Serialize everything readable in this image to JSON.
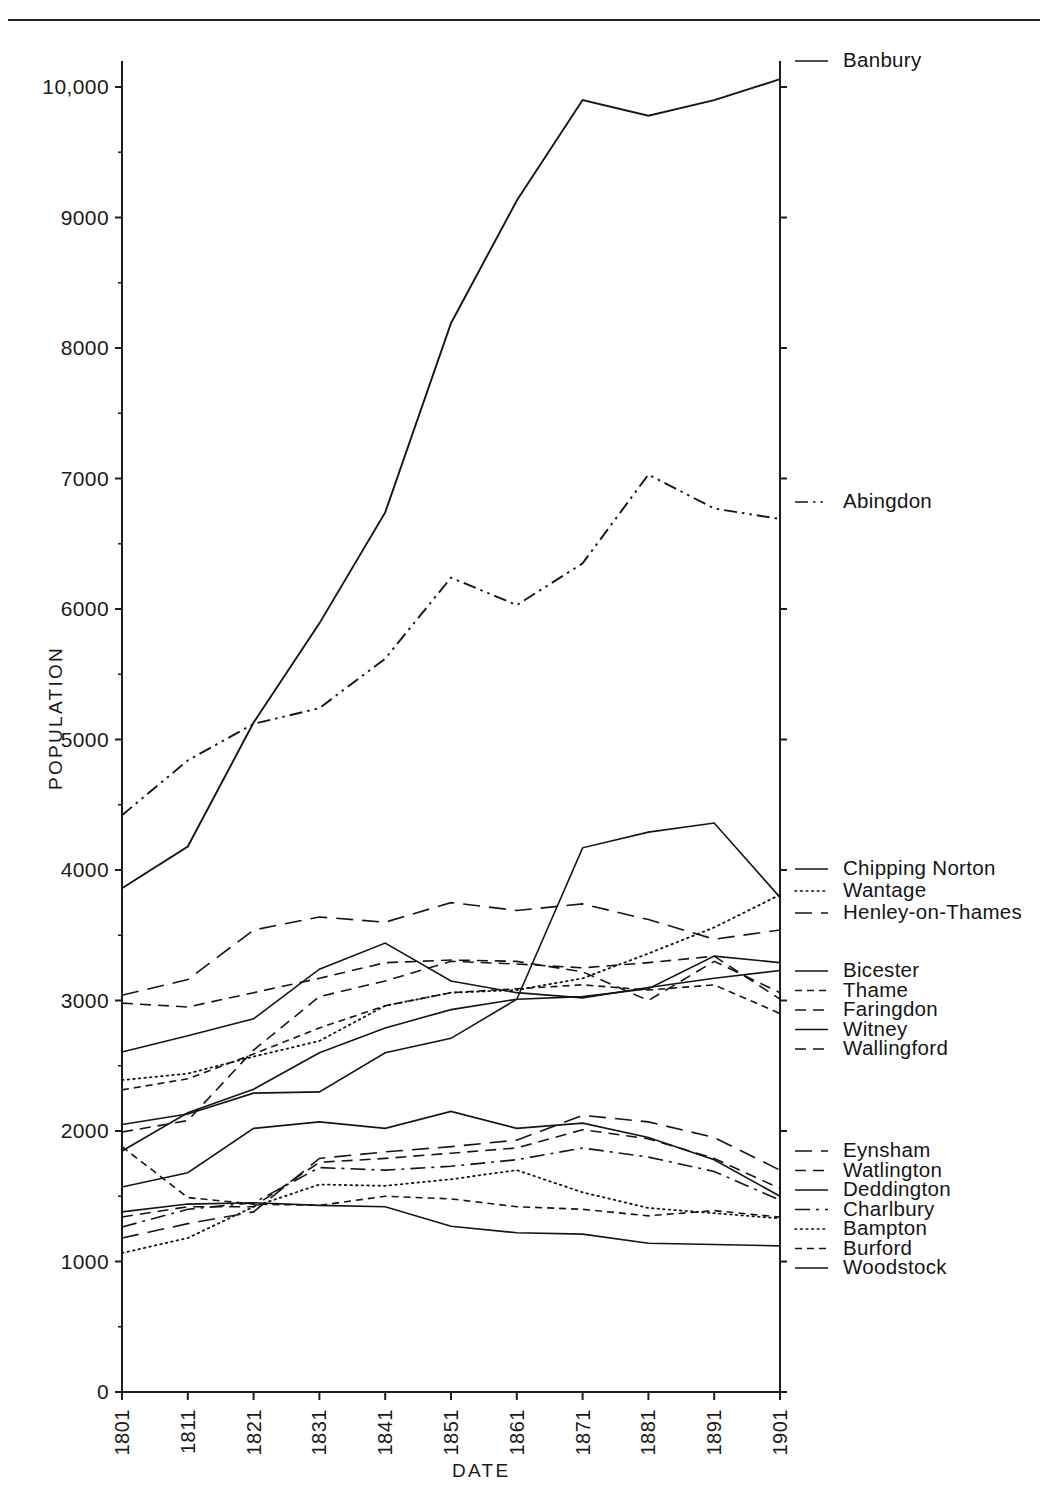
{
  "figure": {
    "xlabel": "DATE",
    "ylabel": "POPULATION"
  },
  "chart_data": {
    "type": "line",
    "title": "",
    "xlabel": "DATE",
    "ylabel": "POPULATION",
    "x": [
      1801,
      1811,
      1821,
      1831,
      1841,
      1851,
      1861,
      1871,
      1881,
      1891,
      1901
    ],
    "xticklabels": [
      "1801",
      "1811",
      "1821",
      "1831",
      "1841",
      "1851",
      "1861",
      "1871",
      "1881",
      "1891",
      "1901"
    ],
    "yticklabels": [
      "0",
      "1000",
      "2000",
      "3000",
      "4000",
      "5000",
      "6000",
      "7000",
      "8000",
      "9000",
      "10,000"
    ],
    "yticks": [
      0,
      1000,
      2000,
      3000,
      4000,
      5000,
      6000,
      7000,
      8000,
      9000,
      10000
    ],
    "ylim": [
      0,
      10200
    ],
    "xlim": [
      1801,
      1901
    ],
    "minor_y_step": 500,
    "grid": false,
    "legend_position": "right",
    "series": [
      {
        "name": "Banbury",
        "style": "solid",
        "values": [
          3860,
          4180,
          5130,
          5890,
          6740,
          8190,
          9130,
          9900,
          9780,
          9900,
          10060
        ]
      },
      {
        "name": "Abingdon",
        "style": "dashdotdot",
        "values": [
          4420,
          4840,
          5120,
          5240,
          5620,
          6240,
          6030,
          6350,
          7030,
          6770,
          6690
        ]
      },
      {
        "name": "Chipping Norton",
        "style": "solid",
        "values": [
          2050,
          2130,
          2290,
          2300,
          2600,
          2710,
          3010,
          4170,
          4290,
          4360,
          3790
        ]
      },
      {
        "name": "Wantage",
        "style": "dotted",
        "values": [
          2390,
          2440,
          2570,
          2690,
          2960,
          3060,
          3080,
          3170,
          3360,
          3560,
          3810
        ]
      },
      {
        "name": "Henley-on-Thames",
        "style": "dashed-long",
        "values": [
          3040,
          3160,
          3540,
          3640,
          3600,
          3750,
          3690,
          3740,
          3620,
          3470,
          3540
        ]
      },
      {
        "name": "Bicester",
        "style": "solid",
        "values": [
          2605,
          2730,
          2860,
          3240,
          3440,
          3150,
          3060,
          3020,
          3100,
          3170,
          3230
        ]
      },
      {
        "name": "Thame",
        "style": "dashed-fine",
        "values": [
          2315,
          2400,
          2590,
          2790,
          2960,
          3060,
          3090,
          3120,
          3080,
          3120,
          2900
        ]
      },
      {
        "name": "Faringdon",
        "style": "dashed",
        "values": [
          2980,
          2950,
          3060,
          3170,
          3290,
          3310,
          3300,
          3220,
          3000,
          3300,
          3060
        ]
      },
      {
        "name": "Witney",
        "style": "solid",
        "values": [
          1847,
          2140,
          2320,
          2600,
          2790,
          2930,
          3010,
          3030,
          3090,
          3340,
          3290
        ]
      },
      {
        "name": "Wallingford",
        "style": "dashed",
        "values": [
          1992,
          2080,
          2620,
          3030,
          3150,
          3300,
          3280,
          3250,
          3290,
          3340,
          3010
        ]
      },
      {
        "name": "Eynsham",
        "style": "dashed-long",
        "values": [
          1180,
          1290,
          1380,
          1790,
          1840,
          1880,
          1930,
          2120,
          2070,
          1950,
          1700
        ]
      },
      {
        "name": "Watlington",
        "style": "dashed",
        "values": [
          1341,
          1420,
          1420,
          1760,
          1790,
          1830,
          1870,
          2010,
          1940,
          1790,
          1560
        ]
      },
      {
        "name": "Deddington",
        "style": "solid",
        "values": [
          1571,
          1680,
          2020,
          2070,
          2020,
          2150,
          2020,
          2060,
          1950,
          1780,
          1500
        ]
      },
      {
        "name": "Charlbury",
        "style": "dashdot",
        "values": [
          1264,
          1400,
          1450,
          1720,
          1700,
          1730,
          1780,
          1870,
          1800,
          1690,
          1470
        ]
      },
      {
        "name": "Bampton",
        "style": "dotted",
        "values": [
          1065,
          1180,
          1420,
          1590,
          1580,
          1630,
          1700,
          1530,
          1410,
          1370,
          1330
        ]
      },
      {
        "name": "Burford",
        "style": "dashed-fine",
        "values": [
          1880,
          1490,
          1440,
          1430,
          1500,
          1480,
          1420,
          1400,
          1350,
          1390,
          1340
        ]
      },
      {
        "name": "Woodstock",
        "style": "solid",
        "values": [
          1380,
          1440,
          1450,
          1430,
          1420,
          1270,
          1220,
          1210,
          1140,
          1130,
          1120
        ]
      }
    ]
  },
  "legend_groups": [
    {
      "id": "g1",
      "items": [
        {
          "label": "Banbury",
          "style": "solid"
        }
      ]
    },
    {
      "id": "g2",
      "items": [
        {
          "label": "Abingdon",
          "style": "dashdotdot"
        }
      ]
    },
    {
      "id": "g3",
      "items": [
        {
          "label": "Chipping Norton",
          "style": "solid"
        },
        {
          "label": "Wantage",
          "style": "dotted"
        },
        {
          "label": "Henley-on-Thames",
          "style": "dashed-long"
        }
      ]
    },
    {
      "id": "g4",
      "items": [
        {
          "label": "Bicester",
          "style": "solid"
        },
        {
          "label": "Thame",
          "style": "dashed-fine"
        },
        {
          "label": "Faringdon",
          "style": "dashed"
        },
        {
          "label": "Witney",
          "style": "solid"
        },
        {
          "label": "Wallingford",
          "style": "dashed"
        }
      ]
    },
    {
      "id": "g5",
      "items": [
        {
          "label": "Eynsham",
          "style": "dashed-long"
        },
        {
          "label": "Watlington",
          "style": "dashed"
        },
        {
          "label": "Deddington",
          "style": "solid"
        },
        {
          "label": "Charlbury",
          "style": "dashdot"
        },
        {
          "label": "Bampton",
          "style": "dotted"
        },
        {
          "label": "Burford",
          "style": "dashed-fine"
        },
        {
          "label": "Woodstock",
          "style": "solid"
        }
      ]
    }
  ]
}
